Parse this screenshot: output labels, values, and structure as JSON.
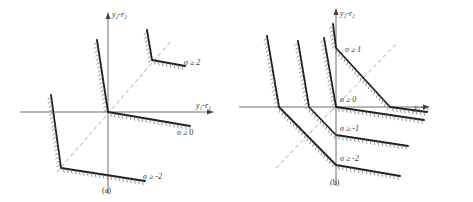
{
  "figure": {
    "panels": [
      {
        "id": "a",
        "caption": "(a)",
        "axes": {
          "x_label": "y₁-r₁",
          "y_label": "y₂-r₂"
        },
        "regions": [
          {
            "label": "σ ≥ 2"
          },
          {
            "label": "σ ≥ 0"
          },
          {
            "label": "σ ≥ -2"
          }
        ]
      },
      {
        "id": "b",
        "caption": "(b)",
        "axes": {
          "x_label": "y₁-r₁",
          "y_label": "y₂-r₂"
        },
        "regions": [
          {
            "label": "σ ≥ 1"
          },
          {
            "label": "σ ≥ 0"
          },
          {
            "label": "σ ≥ -1"
          },
          {
            "label": "σ ≥ -2"
          }
        ]
      }
    ]
  }
}
